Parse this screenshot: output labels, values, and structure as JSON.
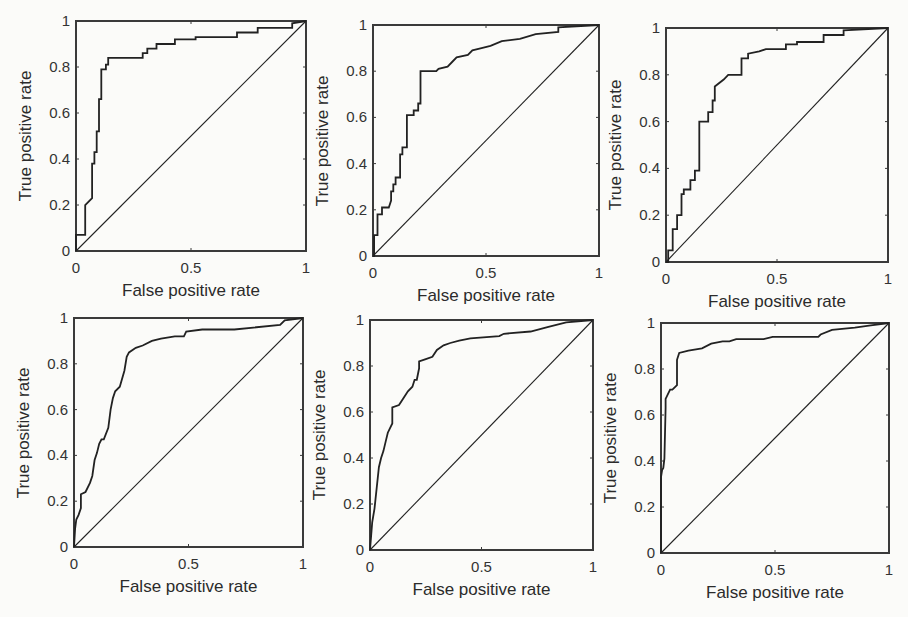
{
  "figure": {
    "layout": "2x3 grid of ROC curves",
    "axis_color": "#3a3a3a",
    "curve_color": "#222222",
    "background": "#fbfbf9"
  },
  "chart_data": [
    {
      "type": "line",
      "panel": "top-left",
      "title": "",
      "xlabel": "False positive rate",
      "ylabel": "True positive rate",
      "xlim": [
        0,
        1
      ],
      "ylim": [
        0,
        1
      ],
      "xticks": [
        "0",
        "0.5",
        "1"
      ],
      "yticks": [
        "0",
        "0.2",
        "0.4",
        "0.6",
        "0.8",
        "1"
      ],
      "grid": false,
      "series": [
        {
          "name": "ROC",
          "x": [
            0,
            0,
            0.01,
            0.01,
            0.04,
            0.04,
            0.07,
            0.07,
            0.08,
            0.08,
            0.09,
            0.09,
            0.1,
            0.1,
            0.11,
            0.11,
            0.13,
            0.13,
            0.14,
            0.14,
            0.29,
            0.29,
            0.31,
            0.31,
            0.35,
            0.35,
            0.43,
            0.43,
            0.52,
            0.52,
            0.7,
            0.7,
            0.79,
            0.79,
            0.94,
            0.94,
            1.0
          ],
          "y": [
            0,
            0.07,
            0.07,
            0.07,
            0.07,
            0.2,
            0.23,
            0.38,
            0.38,
            0.43,
            0.43,
            0.52,
            0.52,
            0.66,
            0.66,
            0.79,
            0.79,
            0.81,
            0.81,
            0.84,
            0.84,
            0.86,
            0.86,
            0.88,
            0.88,
            0.9,
            0.9,
            0.92,
            0.92,
            0.93,
            0.93,
            0.95,
            0.95,
            0.97,
            0.97,
            0.99,
            1.0
          ]
        },
        {
          "name": "Chance",
          "x": [
            0,
            1
          ],
          "y": [
            0,
            1
          ]
        }
      ]
    },
    {
      "type": "line",
      "panel": "top-middle",
      "title": "",
      "xlabel": "False positive rate",
      "ylabel": "True positive rate",
      "xlim": [
        0,
        1
      ],
      "ylim": [
        0,
        1
      ],
      "xticks": [
        "0",
        "0.5",
        "1"
      ],
      "yticks": [
        "0",
        "0.2",
        "0.4",
        "0.6",
        "0.8",
        "1"
      ],
      "grid": false,
      "series": [
        {
          "name": "ROC",
          "x": [
            0,
            0.005,
            0.005,
            0.02,
            0.02,
            0.04,
            0.04,
            0.07,
            0.08,
            0.08,
            0.09,
            0.09,
            0.1,
            0.1,
            0.12,
            0.12,
            0.13,
            0.13,
            0.15,
            0.15,
            0.18,
            0.18,
            0.2,
            0.2,
            0.21,
            0.21,
            0.28,
            0.29,
            0.33,
            0.35,
            0.37,
            0.42,
            0.44,
            0.48,
            0.52,
            0.57,
            0.65,
            0.72,
            0.82,
            0.82,
            1.0
          ],
          "y": [
            0,
            0,
            0.09,
            0.09,
            0.18,
            0.18,
            0.21,
            0.21,
            0.24,
            0.28,
            0.28,
            0.31,
            0.31,
            0.34,
            0.34,
            0.44,
            0.44,
            0.47,
            0.47,
            0.61,
            0.61,
            0.63,
            0.63,
            0.66,
            0.66,
            0.8,
            0.8,
            0.81,
            0.82,
            0.84,
            0.86,
            0.87,
            0.89,
            0.9,
            0.91,
            0.93,
            0.94,
            0.96,
            0.97,
            0.99,
            1.0
          ]
        },
        {
          "name": "Chance",
          "x": [
            0,
            1
          ],
          "y": [
            0,
            1
          ]
        }
      ]
    },
    {
      "type": "line",
      "panel": "top-right",
      "title": "",
      "xlabel": "False positive rate",
      "ylabel": "True positive rate",
      "xlim": [
        0,
        1
      ],
      "ylim": [
        0,
        1
      ],
      "xticks": [
        "0",
        "0.5",
        "1"
      ],
      "yticks": [
        "0",
        "0.2",
        "0.4",
        "0.6",
        "0.8",
        "1"
      ],
      "grid": false,
      "series": [
        {
          "name": "ROC",
          "x": [
            0,
            0.01,
            0.01,
            0.03,
            0.03,
            0.05,
            0.05,
            0.07,
            0.07,
            0.08,
            0.08,
            0.11,
            0.11,
            0.13,
            0.13,
            0.15,
            0.15,
            0.19,
            0.19,
            0.21,
            0.21,
            0.22,
            0.22,
            0.26,
            0.28,
            0.34,
            0.34,
            0.37,
            0.37,
            0.42,
            0.45,
            0.54,
            0.54,
            0.59,
            0.59,
            0.71,
            0.71,
            0.8,
            0.8,
            1.0
          ],
          "y": [
            0,
            0,
            0.05,
            0.05,
            0.14,
            0.14,
            0.2,
            0.2,
            0.29,
            0.29,
            0.31,
            0.31,
            0.35,
            0.35,
            0.39,
            0.39,
            0.6,
            0.6,
            0.64,
            0.64,
            0.69,
            0.69,
            0.75,
            0.78,
            0.8,
            0.8,
            0.87,
            0.87,
            0.89,
            0.9,
            0.91,
            0.91,
            0.93,
            0.93,
            0.94,
            0.94,
            0.97,
            0.97,
            0.99,
            1.0
          ]
        },
        {
          "name": "Chance",
          "x": [
            0,
            1
          ],
          "y": [
            0,
            1
          ]
        }
      ]
    },
    {
      "type": "line",
      "panel": "bottom-left",
      "title": "",
      "xlabel": "False positive rate",
      "ylabel": "True positive rate",
      "xlim": [
        0,
        1
      ],
      "ylim": [
        0,
        1
      ],
      "xticks": [
        "0",
        "0.5",
        "1"
      ],
      "yticks": [
        "0",
        "0.2",
        "0.4",
        "0.6",
        "0.8",
        "1"
      ],
      "grid": false,
      "series": [
        {
          "name": "ROC",
          "x": [
            0,
            0.005,
            0.01,
            0.02,
            0.03,
            0.03,
            0.05,
            0.07,
            0.08,
            0.09,
            0.1,
            0.11,
            0.12,
            0.13,
            0.15,
            0.16,
            0.17,
            0.18,
            0.2,
            0.22,
            0.23,
            0.24,
            0.27,
            0.3,
            0.34,
            0.38,
            0.44,
            0.48,
            0.49,
            0.56,
            0.7,
            0.9,
            0.92,
            1.0
          ],
          "y": [
            0,
            0.08,
            0.12,
            0.14,
            0.17,
            0.23,
            0.24,
            0.28,
            0.31,
            0.38,
            0.41,
            0.45,
            0.47,
            0.47,
            0.52,
            0.6,
            0.65,
            0.68,
            0.7,
            0.77,
            0.83,
            0.85,
            0.87,
            0.88,
            0.9,
            0.91,
            0.92,
            0.92,
            0.94,
            0.95,
            0.95,
            0.97,
            0.99,
            1.0
          ]
        },
        {
          "name": "Chance",
          "x": [
            0,
            1
          ],
          "y": [
            0,
            1
          ]
        }
      ]
    },
    {
      "type": "line",
      "panel": "bottom-middle",
      "title": "",
      "xlabel": "False positive rate",
      "ylabel": "True positive rate",
      "xlim": [
        0,
        1
      ],
      "ylim": [
        0,
        1
      ],
      "xticks": [
        "0",
        "0.5",
        "1"
      ],
      "yticks": [
        "0",
        "0.2",
        "0.4",
        "0.6",
        "0.8",
        "1"
      ],
      "grid": false,
      "series": [
        {
          "name": "ROC",
          "x": [
            0,
            0.005,
            0.01,
            0.02,
            0.03,
            0.04,
            0.05,
            0.06,
            0.07,
            0.08,
            0.1,
            0.1,
            0.13,
            0.15,
            0.17,
            0.19,
            0.2,
            0.21,
            0.22,
            0.22,
            0.25,
            0.28,
            0.3,
            0.33,
            0.36,
            0.4,
            0.45,
            0.58,
            0.6,
            0.72,
            0.8,
            0.88,
            1.0
          ],
          "y": [
            0,
            0.06,
            0.12,
            0.18,
            0.27,
            0.36,
            0.4,
            0.43,
            0.47,
            0.51,
            0.55,
            0.62,
            0.63,
            0.66,
            0.69,
            0.71,
            0.74,
            0.74,
            0.79,
            0.82,
            0.83,
            0.84,
            0.87,
            0.89,
            0.9,
            0.91,
            0.92,
            0.93,
            0.94,
            0.95,
            0.97,
            0.99,
            1.0
          ]
        },
        {
          "name": "Chance",
          "x": [
            0,
            1
          ],
          "y": [
            0,
            1
          ]
        }
      ]
    },
    {
      "type": "line",
      "panel": "bottom-right",
      "title": "",
      "xlabel": "False positive rate",
      "ylabel": "True positive rate",
      "xlim": [
        0,
        1
      ],
      "ylim": [
        0,
        1
      ],
      "xticks": [
        "0",
        "0.5",
        "1"
      ],
      "yticks": [
        "0",
        "0.2",
        "0.4",
        "0.6",
        "0.8",
        "1"
      ],
      "grid": false,
      "series": [
        {
          "name": "ROC",
          "x": [
            0,
            0,
            0.005,
            0.01,
            0.015,
            0.02,
            0.02,
            0.03,
            0.04,
            0.05,
            0.06,
            0.07,
            0.07,
            0.08,
            0.12,
            0.18,
            0.22,
            0.27,
            0.3,
            0.33,
            0.45,
            0.49,
            0.69,
            0.7,
            0.75,
            0.85,
            0.92,
            1.0
          ],
          "y": [
            0,
            0.33,
            0.36,
            0.37,
            0.41,
            0.63,
            0.67,
            0.69,
            0.71,
            0.71,
            0.72,
            0.73,
            0.84,
            0.87,
            0.88,
            0.89,
            0.91,
            0.92,
            0.92,
            0.93,
            0.93,
            0.94,
            0.94,
            0.95,
            0.97,
            0.98,
            0.99,
            1.0
          ]
        },
        {
          "name": "Chance",
          "x": [
            0,
            1
          ],
          "y": [
            0,
            1
          ]
        }
      ]
    }
  ]
}
